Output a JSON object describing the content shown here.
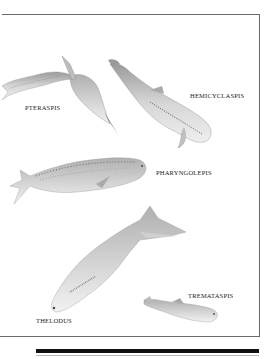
{
  "plate": {
    "labels": {
      "pteraspis": "PTERASPIS",
      "hemicyclaspis": "HEMICYCLASPIS",
      "pharyngolepis": "PHARYNGOLEPIS",
      "thelodus": "THELODUS",
      "trematapsis": "TREMATASPIS"
    },
    "illustrations": [
      {
        "name": "Pteraspis",
        "icon": "fish-pteraspis-illustration"
      },
      {
        "name": "Hemicyclaspis",
        "icon": "fish-hemicyclaspis-illustration"
      },
      {
        "name": "Pharyngolepis",
        "icon": "fish-pharyngolepis-illustration"
      },
      {
        "name": "Thelodus",
        "icon": "fish-thelodus-illustration"
      },
      {
        "name": "Trematapsis",
        "icon": "fish-trematapsis-illustration"
      }
    ],
    "colors": {
      "frame": "#6a6a6a",
      "bar": "#111111",
      "fish": "#c8c8c8"
    }
  }
}
